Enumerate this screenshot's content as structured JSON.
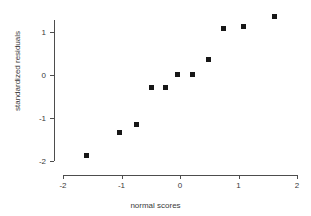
{
  "chart_data": {
    "type": "scatter",
    "title": "",
    "xlabel": "normal scores",
    "ylabel": "standardized residuals",
    "xlim": [
      -2.1,
      2.1
    ],
    "ylim": [
      -2.1,
      1.6
    ],
    "x_ticks": [
      -2,
      -1,
      0,
      1,
      2
    ],
    "x_tick_labels": [
      "-2",
      "-1",
      "0",
      "1",
      "2"
    ],
    "y_ticks": [
      -2,
      -1,
      0,
      1
    ],
    "y_tick_labels": [
      "-2",
      "-1",
      "0",
      "1"
    ],
    "grid": false,
    "legend": null,
    "marker": "square",
    "marker_color": "#171717",
    "axis_color": "#4d4d4d",
    "points": [
      {
        "x": -1.59,
        "y": -1.87
      },
      {
        "x": -1.04,
        "y": -1.33
      },
      {
        "x": -0.74,
        "y": -1.16
      },
      {
        "x": -0.48,
        "y": -0.3
      },
      {
        "x": -0.24,
        "y": -0.28
      },
      {
        "x": -0.05,
        "y": 0.02
      },
      {
        "x": 0.21,
        "y": 0.02
      },
      {
        "x": 0.48,
        "y": 0.37
      },
      {
        "x": 0.74,
        "y": 1.09
      },
      {
        "x": 1.08,
        "y": 1.12
      },
      {
        "x": 1.61,
        "y": 1.37
      }
    ]
  }
}
